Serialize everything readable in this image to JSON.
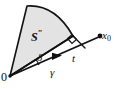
{
  "figure": {
    "type": "geometry-diagram",
    "background_color": "#ffffff",
    "stroke_color": "#111111",
    "sector_fill_color": "#e3e3e3",
    "labels": {
      "sector": "S",
      "sector_prime": "″",
      "origin": "0",
      "angle": "δ",
      "ray": "γ",
      "segment": "t",
      "point": "x",
      "point_subscript": "0"
    },
    "elements": [
      {
        "name": "shaded-sector",
        "label": "S″",
        "description": "shaded circular sector at apex origin"
      },
      {
        "name": "origin-point",
        "label": "0"
      },
      {
        "name": "angle-delta",
        "label": "δ",
        "description": "angle between ray gamma and sector edge"
      },
      {
        "name": "ray-gamma",
        "label": "γ",
        "description": "arrow ray from origin toward x0"
      },
      {
        "name": "segment-t",
        "label": "t",
        "description": "distance along ray"
      },
      {
        "name": "perpendicular-drop",
        "label": "",
        "description": "perpendicular from sector vertex to ray"
      },
      {
        "name": "right-angle-mark",
        "label": ""
      },
      {
        "name": "point-x0",
        "label": "x0"
      }
    ]
  }
}
